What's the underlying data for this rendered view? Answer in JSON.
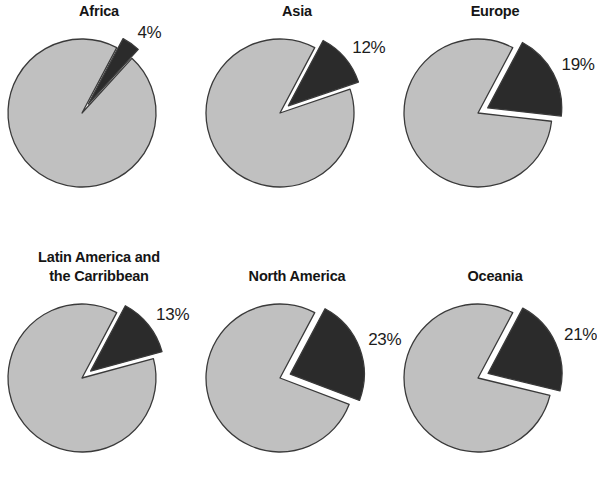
{
  "chart_data": {
    "type": "pie",
    "title": "",
    "subtitle": "",
    "xlabel": "",
    "ylabel": "",
    "legend": [],
    "layout": {
      "rows": 2,
      "columns": 3,
      "grid": false,
      "legend_position": "none",
      "panel_order": [
        "Africa",
        "Asia",
        "Europe",
        "Latin America and\nthe Carribbean",
        "North America",
        "Oceania"
      ]
    },
    "colors": {
      "highlight_slice": "#2b2b2b",
      "remainder_slice": "#c0c0c0",
      "slice_outline": "#3a3a3a",
      "background": "#ffffff",
      "text": "#151515"
    },
    "panels": [
      {
        "title": "Africa",
        "highlight_value": 4,
        "highlight_label": "4%",
        "remainder_value": 96,
        "slices": [
          {
            "name": "highlight",
            "value": 4,
            "label": "4%",
            "color": "#2b2b2b",
            "exploded": true
          },
          {
            "name": "remainder",
            "value": 96,
            "label": "",
            "color": "#c0c0c0",
            "exploded": false
          }
        ]
      },
      {
        "title": "Asia",
        "highlight_value": 12,
        "highlight_label": "12%",
        "remainder_value": 88,
        "slices": [
          {
            "name": "highlight",
            "value": 12,
            "label": "12%",
            "color": "#2b2b2b",
            "exploded": true
          },
          {
            "name": "remainder",
            "value": 88,
            "label": "",
            "color": "#c0c0c0",
            "exploded": false
          }
        ]
      },
      {
        "title": "Europe",
        "highlight_value": 19,
        "highlight_label": "19%",
        "remainder_value": 81,
        "slices": [
          {
            "name": "highlight",
            "value": 19,
            "label": "19%",
            "color": "#2b2b2b",
            "exploded": true
          },
          {
            "name": "remainder",
            "value": 81,
            "label": "",
            "color": "#c0c0c0",
            "exploded": false
          }
        ]
      },
      {
        "title": "Latin America and\nthe Carribbean",
        "highlight_value": 13,
        "highlight_label": "13%",
        "remainder_value": 87,
        "slices": [
          {
            "name": "highlight",
            "value": 13,
            "label": "13%",
            "color": "#2b2b2b",
            "exploded": true
          },
          {
            "name": "remainder",
            "value": 87,
            "label": "",
            "color": "#c0c0c0",
            "exploded": false
          }
        ]
      },
      {
        "title": "North America",
        "highlight_value": 23,
        "highlight_label": "23%",
        "remainder_value": 77,
        "slices": [
          {
            "name": "highlight",
            "value": 23,
            "label": "23%",
            "color": "#2b2b2b",
            "exploded": true
          },
          {
            "name": "remainder",
            "value": 77,
            "label": "",
            "color": "#c0c0c0",
            "exploded": false
          }
        ]
      },
      {
        "title": "Oceania",
        "highlight_value": 21,
        "highlight_label": "21%",
        "remainder_value": 79,
        "slices": [
          {
            "name": "highlight",
            "value": 21,
            "label": "21%",
            "color": "#2b2b2b",
            "exploded": true
          },
          {
            "name": "remainder",
            "value": 79,
            "label": "",
            "color": "#c0c0c0",
            "exploded": false
          }
        ]
      }
    ]
  }
}
